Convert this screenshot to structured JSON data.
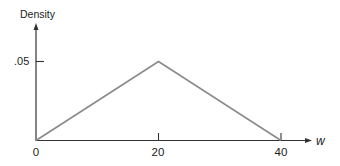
{
  "chart_data": {
    "type": "line",
    "title": "",
    "xlabel": "w",
    "ylabel": "Density",
    "x": [
      0,
      20,
      40
    ],
    "series": [
      {
        "name": "density",
        "values": [
          0,
          0.05,
          0
        ]
      }
    ],
    "xticks": [
      0,
      20,
      40
    ],
    "xtick_labels": [
      "0",
      "20",
      "40"
    ],
    "yticks": [
      0.05
    ],
    "ytick_labels": [
      ".05"
    ],
    "xlim": [
      0,
      40
    ],
    "ylim": [
      0,
      0.05
    ],
    "grid": false,
    "legend": "none",
    "colors": {
      "line": "#8a8a8a",
      "axes": "#333333"
    }
  },
  "labels": {
    "ylabel": "Density",
    "xlabel": "w",
    "ytick_05": ".05",
    "xtick_0": "0",
    "xtick_20": "20",
    "xtick_40": "40"
  }
}
